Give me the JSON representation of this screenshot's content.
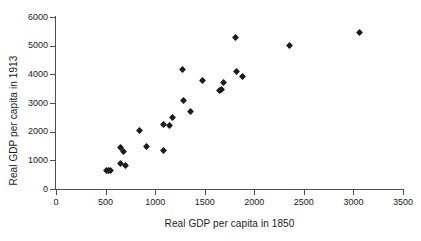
{
  "chart_data": {
    "type": "scatter",
    "title": "",
    "xlabel": "Real GDP per capita in 1850",
    "ylabel": "Real GDP per capita in 1913",
    "xlim": [
      0,
      3500
    ],
    "ylim": [
      0,
      6000
    ],
    "xticks": [
      0,
      500,
      1000,
      1500,
      2000,
      2500,
      3000,
      3500
    ],
    "yticks": [
      0,
      1000,
      2000,
      3000,
      4000,
      5000,
      6000
    ],
    "xtick_labels": [
      "0",
      "500",
      "1000",
      "1500",
      "2000",
      "2500",
      "3000",
      "3500"
    ],
    "ytick_labels": [
      "0",
      "1000",
      "2000",
      "3000",
      "4000",
      "5000",
      "6000"
    ],
    "grid": false,
    "legend": false,
    "marker_shape": "diamond",
    "marker_color": "#1c1c1c",
    "axis_color": "#4d4d4d",
    "background": "#ffffff",
    "points": [
      {
        "x": 510,
        "y": 650
      },
      {
        "x": 525,
        "y": 640
      },
      {
        "x": 545,
        "y": 645
      },
      {
        "x": 650,
        "y": 900
      },
      {
        "x": 655,
        "y": 1440
      },
      {
        "x": 685,
        "y": 1300
      },
      {
        "x": 700,
        "y": 820
      },
      {
        "x": 845,
        "y": 2030
      },
      {
        "x": 910,
        "y": 1470
      },
      {
        "x": 1085,
        "y": 1330
      },
      {
        "x": 1085,
        "y": 2250
      },
      {
        "x": 1140,
        "y": 2225
      },
      {
        "x": 1180,
        "y": 2480
      },
      {
        "x": 1280,
        "y": 4180
      },
      {
        "x": 1285,
        "y": 3075
      },
      {
        "x": 1355,
        "y": 2720
      },
      {
        "x": 1480,
        "y": 3800
      },
      {
        "x": 1650,
        "y": 3420
      },
      {
        "x": 1665,
        "y": 3460
      },
      {
        "x": 1690,
        "y": 3710
      },
      {
        "x": 1810,
        "y": 5280
      },
      {
        "x": 1820,
        "y": 4090
      },
      {
        "x": 1880,
        "y": 3910
      },
      {
        "x": 2360,
        "y": 4990
      },
      {
        "x": 3060,
        "y": 5450
      }
    ]
  }
}
